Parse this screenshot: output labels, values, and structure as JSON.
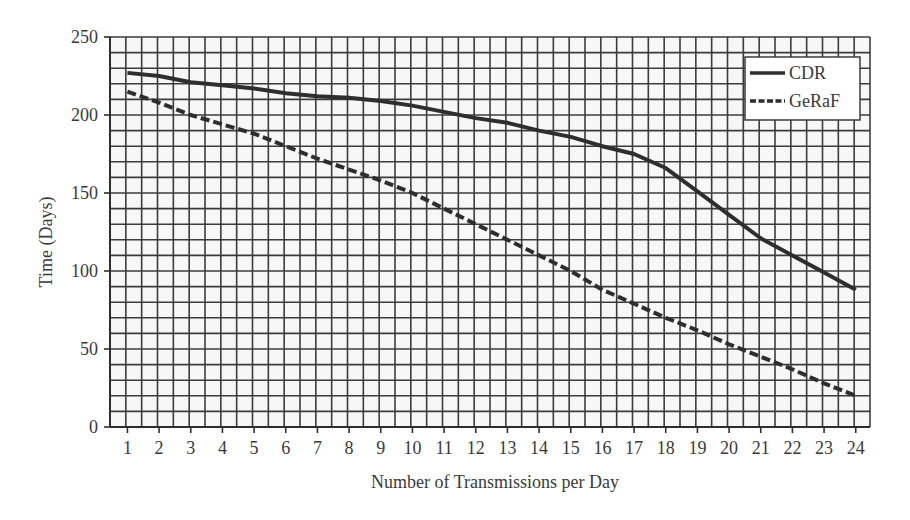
{
  "chart_data": {
    "type": "line",
    "title": "",
    "xlabel": "Number of Transmissions per Day",
    "ylabel": "Time (Days)",
    "x": [
      1,
      2,
      3,
      4,
      5,
      6,
      7,
      8,
      9,
      10,
      11,
      12,
      13,
      14,
      15,
      16,
      17,
      18,
      19,
      20,
      21,
      22,
      23,
      24
    ],
    "x_tick_labels": [
      "1",
      "2",
      "3",
      "4",
      "5",
      "6",
      "7",
      "8",
      "9",
      "10",
      "11",
      "12",
      "13",
      "14",
      "15",
      "16",
      "17",
      "18",
      "19",
      "20",
      "21",
      "22",
      "23",
      "24"
    ],
    "y_tick_labels": [
      "0",
      "50",
      "100",
      "150",
      "200",
      "250"
    ],
    "y_ticks": [
      0,
      50,
      100,
      150,
      200,
      250
    ],
    "ylim": [
      0,
      250
    ],
    "xlim": [
      0.45,
      24.45
    ],
    "grid": true,
    "grid_minor_y_step": 10,
    "grid_minor_x_step": 0.5,
    "legend_position": "upper right",
    "series": [
      {
        "name": "CDR",
        "style": "solid",
        "color": "#2e2e2e",
        "values": [
          227,
          225,
          221,
          219,
          217,
          214,
          212,
          211,
          209,
          206,
          202,
          198,
          195,
          190,
          186,
          180,
          175,
          166,
          151,
          136,
          121,
          110,
          99,
          88
        ]
      },
      {
        "name": "GeRaF",
        "style": "dashed",
        "color": "#2e2e2e",
        "values": [
          215,
          208,
          200,
          194,
          188,
          180,
          172,
          165,
          158,
          150,
          140,
          130,
          120,
          110,
          100,
          88,
          79,
          70,
          62,
          53,
          45,
          37,
          28,
          20
        ]
      }
    ]
  },
  "colors": {
    "grid": "#3c3c3c",
    "axis": "#2e2e2e",
    "text": "#3a3a3a",
    "background": "#ffffff",
    "plot_background": "#f7f7f7"
  }
}
